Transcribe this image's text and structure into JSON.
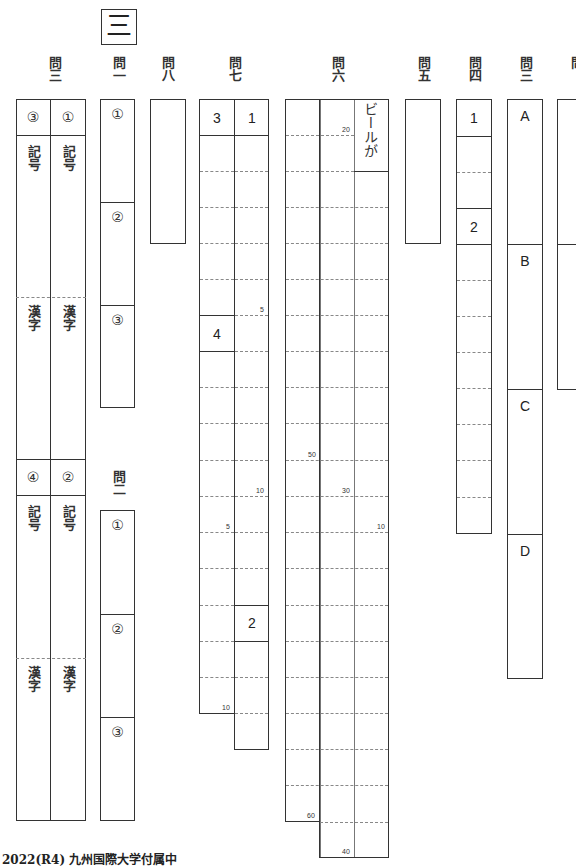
{
  "section": "三",
  "questions": {
    "q3_left": "問三",
    "q1": "問一",
    "q8": "問八",
    "q7": "問七",
    "q6": "問六",
    "q5": "問五",
    "q4": "問四",
    "q3_right": "問三",
    "q2": "問二",
    "cut": "問"
  },
  "q3_left": {
    "cells": [
      {
        "mark": "③",
        "kigou": "記号",
        "kanji": "漢字"
      },
      {
        "mark": "①",
        "kigou": "記号",
        "kanji": "漢字"
      },
      {
        "mark": "④",
        "kigou": "記号",
        "kanji": "漢字"
      },
      {
        "mark": "②",
        "kigou": "記号",
        "kanji": "漢字"
      }
    ]
  },
  "q1": {
    "marks": [
      "①",
      "②",
      "③"
    ]
  },
  "q2": {
    "marks": [
      "①",
      "②",
      "③"
    ]
  },
  "q7": {
    "labels": [
      "3",
      "1",
      "4",
      "2"
    ],
    "counts": [
      "5",
      "10",
      "5",
      "10"
    ]
  },
  "q6": {
    "prefilled": "ビールが",
    "counts": [
      "20",
      "50",
      "30",
      "10",
      "60",
      "40"
    ]
  },
  "q4": {
    "labels": [
      "1",
      "2"
    ]
  },
  "q3_right": {
    "labels": [
      "A",
      "B",
      "C",
      "D"
    ]
  },
  "footer": "2022(R4) 九州国際大学付属中"
}
